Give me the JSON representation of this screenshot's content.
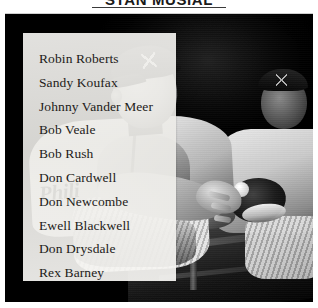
{
  "heading": {
    "title": "STAN MUSIAL"
  },
  "photo": {
    "caption_alt": "Black and white photograph of Philadelphia Phillies baseball players seated in a dugout",
    "jersey_script_front": "Phili",
    "jersey_script_back": "hili",
    "colors": {
      "frame": "#0a0a0a",
      "panel": "#f3f2ef",
      "text": "#1d1b19"
    }
  },
  "name_panel": {
    "names": [
      "Robin Roberts",
      "Sandy Koufax",
      "Johnny Vander Meer",
      "Bob Veale",
      "Bob Rush",
      "Don Cardwell",
      "Don Newcombe",
      "Ewell Blackwell",
      "Don Drysdale",
      "Rex Barney"
    ]
  }
}
